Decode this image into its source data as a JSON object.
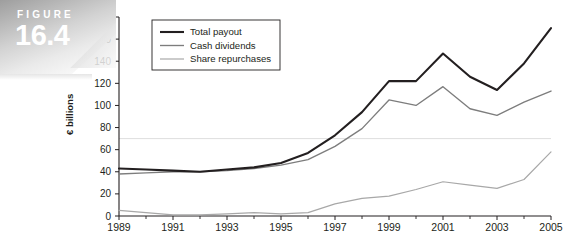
{
  "figure": {
    "word": "FIGURE",
    "number": "16.4"
  },
  "chart_data": {
    "type": "line",
    "title": "",
    "xlabel": "",
    "ylabel": "€ billions",
    "xlim": [
      1989,
      2005
    ],
    "ylim": [
      0,
      180
    ],
    "ytick_step": 20,
    "yticks": [
      0,
      20,
      40,
      60,
      80,
      100,
      120,
      140,
      160,
      180
    ],
    "ytick_labels": [
      "0",
      "20",
      "40",
      "60",
      "80",
      "100",
      "120",
      "140",
      "160",
      "180"
    ],
    "x": [
      1989,
      1990,
      1991,
      1992,
      1993,
      1994,
      1995,
      1996,
      1997,
      1998,
      1999,
      2000,
      2001,
      2002,
      2003,
      2004,
      2005
    ],
    "xticks": [
      1989,
      1990,
      1991,
      1992,
      1993,
      1994,
      1995,
      1996,
      1997,
      1998,
      1999,
      2000,
      2001,
      2002,
      2003,
      2004,
      2005
    ],
    "xtick_labels_shown": [
      "1989",
      "1991",
      "1993",
      "1995",
      "1997",
      "1999",
      "2001",
      "2003",
      "2005"
    ],
    "grid": false,
    "legend_position": "top-left inside",
    "series": [
      {
        "name": "Total payout",
        "color": "#231f20",
        "values": [
          43,
          42,
          41,
          40,
          42,
          44,
          48,
          57,
          73,
          94,
          122,
          122,
          147,
          126,
          114,
          138,
          170
        ]
      },
      {
        "name": "Cash dividends",
        "color": "#7d7d7d",
        "values": [
          38,
          39,
          40,
          40,
          41,
          43,
          46,
          51,
          63,
          79,
          105,
          100,
          117,
          97,
          91,
          103,
          113
        ]
      },
      {
        "name": "Share repurchases",
        "color": "#a8a8a8",
        "values": [
          5,
          3,
          1,
          1,
          2,
          3,
          2,
          3,
          11,
          16,
          18,
          24,
          31,
          28,
          25,
          33,
          58
        ]
      }
    ]
  },
  "legend": {
    "items": [
      {
        "label": "Total payout"
      },
      {
        "label": "Cash dividends"
      },
      {
        "label": "Share repurchases"
      }
    ]
  }
}
